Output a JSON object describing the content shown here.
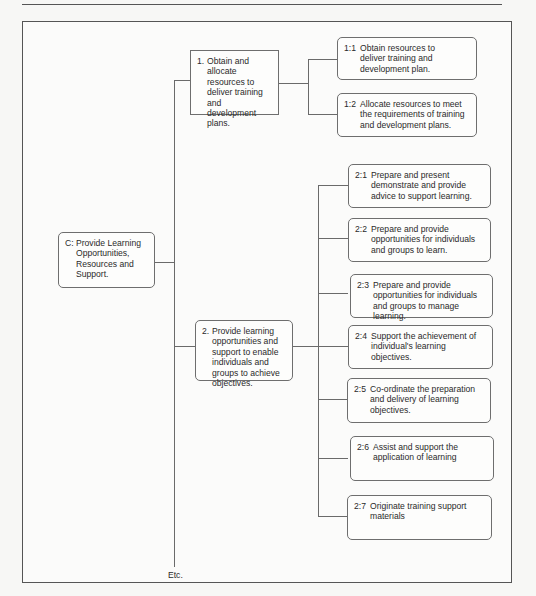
{
  "diagram": {
    "root": {
      "number": "C:",
      "label": "Provide Learning Opportunities, Resources and Support."
    },
    "branches": [
      {
        "number": "1.",
        "label": "Obtain and allocate resources to deliver training and development plans.",
        "children": [
          {
            "number": "1:1",
            "label": "Obtain resources to deliver training and development plan."
          },
          {
            "number": "1:2",
            "label": "Allocate resources to meet the requirements of training and development plans."
          }
        ]
      },
      {
        "number": "2.",
        "label": "Provide learning opportunities and support to enable individuals and groups to achieve objectives.",
        "children": [
          {
            "number": "2:1",
            "label": "Prepare and present demonstrate and provide advice to support learning."
          },
          {
            "number": "2:2",
            "label": "Prepare and provide opportunities for individuals and groups to learn."
          },
          {
            "number": "2:3",
            "label": "Prepare and provide opportunities for individuals and groups to manage learning."
          },
          {
            "number": "2:4",
            "label": "Support the achievement of individual's learning objectives."
          },
          {
            "number": "2:5",
            "label": "Co-ordinate the preparation and delivery of learning objectives."
          },
          {
            "number": "2:6",
            "label": "Assist and support the application of learning"
          },
          {
            "number": "2:7",
            "label": "Originate training support materials"
          }
        ]
      }
    ],
    "continuation": "Etc."
  },
  "colors": {
    "line": "#6a6a6a",
    "border": "#555555",
    "background": "#f7f7f5"
  }
}
